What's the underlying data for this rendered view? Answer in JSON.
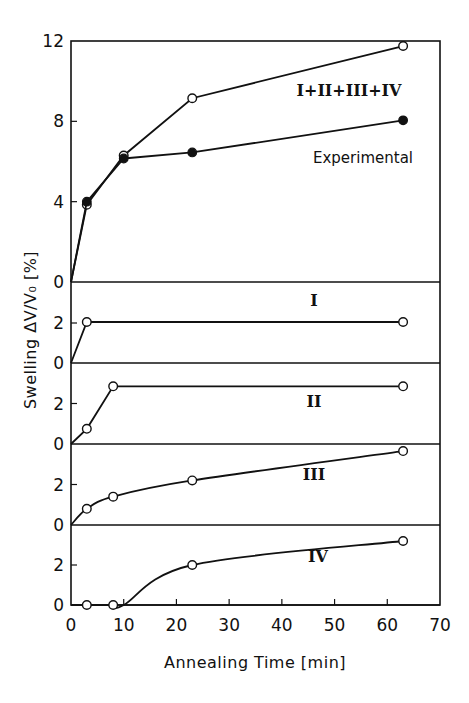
{
  "chart_data": {
    "type": "line",
    "xlabel": "Annealing Time [min]",
    "ylabel": "Swelling ΔV/V₀ [%]",
    "xlim": [
      0,
      70
    ],
    "xticks": [
      "0",
      "10",
      "20",
      "30",
      "40",
      "50",
      "60",
      "70"
    ],
    "xtick_values": [
      0,
      10,
      20,
      30,
      40,
      50,
      60,
      70
    ],
    "grid": false,
    "panels": [
      {
        "name": "total",
        "ylim": [
          0,
          12
        ],
        "yticks": [
          "0",
          "4",
          "8",
          "12"
        ],
        "ytick_values": [
          0,
          4,
          8,
          12
        ],
        "series": [
          {
            "name": "I+II+III+IV",
            "label": "I+II+III+IV",
            "marker": "open-circle",
            "smooth": false,
            "x": [
              0,
              3,
              10,
              23,
              63
            ],
            "y": [
              0,
              3.85,
              6.3,
              9.15,
              11.75
            ],
            "marked": [
              false,
              true,
              true,
              true,
              true
            ]
          },
          {
            "name": "Experimental",
            "label": "Experimental",
            "marker": "filled-circle",
            "smooth": false,
            "x": [
              0,
              3,
              10,
              23,
              63
            ],
            "y": [
              0,
              4.0,
              6.15,
              6.45,
              8.05
            ],
            "marked": [
              false,
              true,
              true,
              true,
              true
            ]
          }
        ]
      },
      {
        "name": "I",
        "ylim": [
          0,
          4
        ],
        "yticks": [
          "0",
          "2"
        ],
        "ytick_values": [
          0,
          2
        ],
        "series": [
          {
            "name": "I",
            "label": "I",
            "marker": "open-circle",
            "smooth": false,
            "x": [
              0,
              3,
              63
            ],
            "y": [
              0,
              2.05,
              2.05
            ],
            "marked": [
              false,
              true,
              true
            ]
          }
        ]
      },
      {
        "name": "II",
        "ylim": [
          0,
          4
        ],
        "yticks": [
          "0",
          "2"
        ],
        "ytick_values": [
          0,
          2
        ],
        "series": [
          {
            "name": "II",
            "label": "II",
            "marker": "open-circle",
            "smooth": false,
            "x": [
              0,
              3,
              8,
              63
            ],
            "y": [
              0,
              0.75,
              2.85,
              2.85
            ],
            "marked": [
              false,
              true,
              true,
              true
            ]
          }
        ]
      },
      {
        "name": "III",
        "ylim": [
          0,
          4
        ],
        "yticks": [
          "0",
          "2"
        ],
        "ytick_values": [
          0,
          2
        ],
        "series": [
          {
            "name": "III",
            "label": "III",
            "marker": "open-circle",
            "smooth": true,
            "x": [
              0,
              3,
              8,
              23,
              63
            ],
            "y": [
              0,
              0.8,
              1.4,
              2.2,
              3.65
            ],
            "marked": [
              false,
              true,
              true,
              true,
              true
            ]
          }
        ]
      },
      {
        "name": "IV",
        "ylim": [
          0,
          4
        ],
        "yticks": [
          "0",
          "2"
        ],
        "ytick_values": [
          0,
          2
        ],
        "series": [
          {
            "name": "IV",
            "label": "IV",
            "marker": "open-circle",
            "smooth": true,
            "x": [
              0,
              3,
              8,
              10,
              23,
              63
            ],
            "y": [
              0,
              0,
              0,
              0,
              2.0,
              3.2
            ],
            "marked": [
              false,
              true,
              true,
              false,
              true,
              true
            ]
          }
        ]
      }
    ]
  }
}
